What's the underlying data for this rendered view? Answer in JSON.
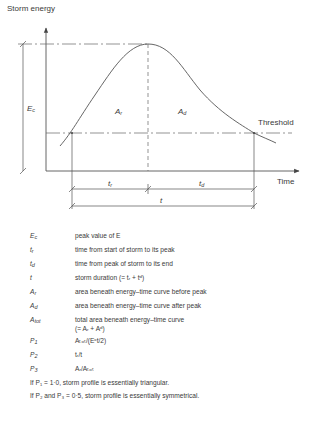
{
  "diagram": {
    "y_axis_label": "Storm energy",
    "x_axis_label": "Time",
    "threshold_label": "Threshold",
    "peak_label": "E",
    "peak_label_sub": "c",
    "area_before_label": "A",
    "area_before_sub": "r",
    "area_after_label": "A",
    "area_after_sub": "d",
    "dim_rise_label": "t",
    "dim_rise_sub": "r",
    "dim_decay_label": "t",
    "dim_decay_sub": "d",
    "dim_total_label": "t",
    "colors": {
      "line": "#555555",
      "text": "#3a3a3a",
      "background": "#ffffff"
    }
  },
  "legend": {
    "items": [
      {
        "sym": "E",
        "sub": "c",
        "desc": "peak value of E"
      },
      {
        "sym": "t",
        "sub": "r",
        "desc": "time from start of storm to its peak"
      },
      {
        "sym": "t",
        "sub": "d",
        "desc": "time from peak of storm to its end"
      },
      {
        "sym": "t",
        "sub": "",
        "desc": "storm duration (= tᵣ + tᵈ)"
      },
      {
        "sym": "A",
        "sub": "r",
        "desc": "area beneath energy–time curve before peak"
      },
      {
        "sym": "A",
        "sub": "d",
        "desc": "area beneath energy–time curve after peak"
      },
      {
        "sym": "A",
        "sub": "tot",
        "desc": "total area beneath energy–time curve",
        "desc2": "(= Aᵣ + Aᵈ)"
      },
      {
        "sym": "P",
        "sub": "1",
        "desc": "Aₜₒₜ/(Eᶜt/2)"
      },
      {
        "sym": "P",
        "sub": "2",
        "desc": "tᵣ/t"
      },
      {
        "sym": "P",
        "sub": "3",
        "desc": "Aᵣ/Aₜₒₜ"
      }
    ],
    "notes": [
      "If P₁ = 1·0, storm profile is essentially triangular.",
      "If P₂ and P₃ = 0·5, storm profile is essentially symmetrical."
    ]
  }
}
